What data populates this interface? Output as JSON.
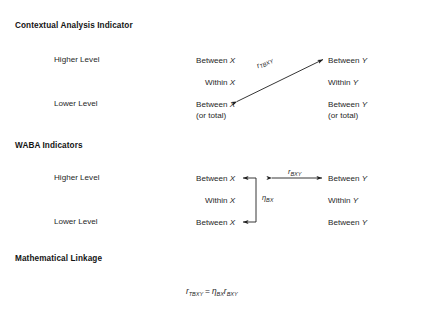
{
  "figure": {
    "sections": [
      {
        "id": "contextual",
        "title": "Contextual Analysis Indicator",
        "rows": [
          {
            "level_label": "Higher Level",
            "left_line1": "Between",
            "left_var": "X",
            "left_line2": "",
            "right_line1": "Between",
            "right_var": "Y",
            "right_line2": ""
          },
          {
            "level_label": "",
            "left_line1": "Within",
            "left_var": "X",
            "left_line2": "",
            "right_line1": "Within",
            "right_var": "Y",
            "right_line2": ""
          },
          {
            "level_label": "Lower Level",
            "left_line1": "Between",
            "left_var": "X",
            "left_line2": "(or total)",
            "right_line1": "Between",
            "right_var": "Y",
            "right_line2": "(or total)"
          }
        ],
        "arrow_label_base": "r",
        "arrow_label_sub": "TBXY"
      },
      {
        "id": "waba",
        "title": "WABA Indicators",
        "rows": [
          {
            "level_label": "Higher Level",
            "left_line1": "Between",
            "left_var": "X",
            "left_line2": "",
            "right_line1": "Between",
            "right_var": "Y",
            "right_line2": ""
          },
          {
            "level_label": "",
            "left_line1": "Within",
            "left_var": "X",
            "left_line2": "",
            "right_line1": "Within",
            "right_var": "Y",
            "right_line2": ""
          },
          {
            "level_label": "Lower Level",
            "left_line1": "Between",
            "left_var": "X",
            "left_line2": "",
            "right_line1": "Between",
            "right_var": "Y",
            "right_line2": ""
          }
        ],
        "horizontal_label_base": "r",
        "horizontal_label_sub": "BXY",
        "vertical_label_base": "η",
        "vertical_label_sub": "BX"
      },
      {
        "id": "linkage",
        "title": "Mathematical Linkage",
        "equation": {
          "lhs_base": "r",
          "lhs_sub": "TBXY",
          "operator": "=",
          "rhs1_base": "η",
          "rhs1_sub": "BX",
          "rhs2_base": "r",
          "rhs2_sub": "BXY"
        }
      }
    ],
    "colors": {
      "ink": "#1f1f1f",
      "rule": "#2b2b2b",
      "background": "#ffffff"
    }
  }
}
